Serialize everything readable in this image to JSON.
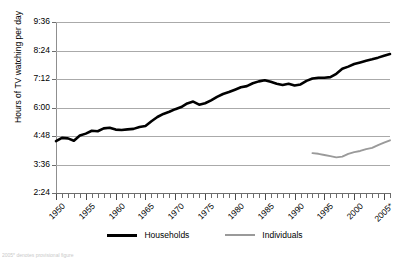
{
  "chart_data": {
    "type": "line",
    "title": "",
    "xlabel": "",
    "ylabel": "Hours of TV watching per day",
    "grid": true,
    "legend_position": "bottom-center",
    "xlim": [
      1950,
      2006
    ],
    "ylim_hours": [
      2.4,
      9.6
    ],
    "ytick_labels": [
      "2:24",
      "3:36",
      "4:48",
      "6:00",
      "7:12",
      "8:24",
      "9:36"
    ],
    "ytick_values_hours": [
      2.4,
      3.6,
      4.8,
      6.0,
      7.2,
      8.4,
      9.6
    ],
    "xtick_labels": [
      "1950",
      "1955",
      "1960",
      "1965",
      "1970",
      "1975",
      "1980",
      "1985",
      "1990",
      "1995",
      "2000",
      "2005*"
    ],
    "xtick_values": [
      1950,
      1955,
      1960,
      1965,
      1970,
      1975,
      1980,
      1985,
      1990,
      1995,
      2000,
      2005
    ],
    "minor_tick_interval": 1,
    "footnote": "2005* denotes provisional figure",
    "series": [
      {
        "name": "Households",
        "color": "#000000",
        "x": [
          1950,
          1951,
          1952,
          1953,
          1954,
          1955,
          1956,
          1957,
          1958,
          1959,
          1960,
          1961,
          1962,
          1963,
          1964,
          1965,
          1966,
          1967,
          1968,
          1969,
          1970,
          1971,
          1972,
          1973,
          1974,
          1975,
          1976,
          1977,
          1978,
          1979,
          1980,
          1981,
          1982,
          1983,
          1984,
          1985,
          1986,
          1987,
          1988,
          1989,
          1990,
          1991,
          1992,
          1993,
          1994,
          1995,
          1996,
          1997,
          1998,
          1999,
          2000,
          2001,
          2002,
          2003,
          2004,
          2005,
          2006
        ],
        "values": [
          4.58,
          4.72,
          4.7,
          4.6,
          4.82,
          4.9,
          5.02,
          5.0,
          5.12,
          5.15,
          5.07,
          5.05,
          5.08,
          5.1,
          5.18,
          5.22,
          5.42,
          5.6,
          5.73,
          5.82,
          5.93,
          6.02,
          6.17,
          6.25,
          6.12,
          6.18,
          6.3,
          6.45,
          6.57,
          6.65,
          6.75,
          6.85,
          6.9,
          7.02,
          7.1,
          7.15,
          7.08,
          7.0,
          6.95,
          7.0,
          6.93,
          6.97,
          7.12,
          7.22,
          7.25,
          7.25,
          7.28,
          7.42,
          7.63,
          7.72,
          7.83,
          7.9,
          7.97,
          8.03,
          8.1,
          8.18,
          8.25
        ],
        "units": "hours per day"
      },
      {
        "name": "Individuals",
        "color": "#9a9a9a",
        "x": [
          1993,
          1994,
          1995,
          1996,
          1997,
          1998,
          1999,
          2000,
          2001,
          2002,
          2003,
          2004,
          2005,
          2006
        ],
        "values": [
          4.08,
          4.05,
          4.0,
          3.95,
          3.9,
          3.93,
          4.05,
          4.12,
          4.17,
          4.25,
          4.3,
          4.42,
          4.52,
          4.62
        ],
        "units": "hours per day"
      }
    ]
  },
  "legend": {
    "items": [
      {
        "label": "Households"
      },
      {
        "label": "Individuals"
      }
    ]
  }
}
